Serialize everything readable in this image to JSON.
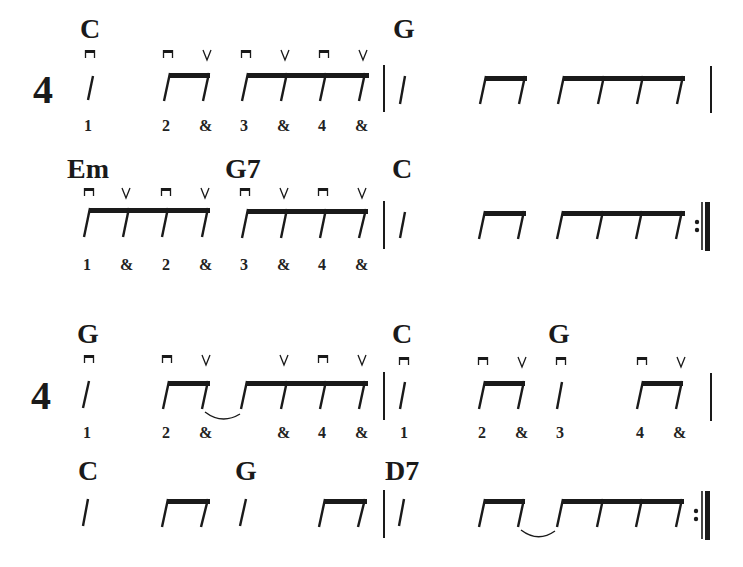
{
  "page": {
    "time_signature": "4",
    "colors": {
      "ink": "#1a1a1a",
      "paper": "#ffffff"
    }
  },
  "systems": [
    {
      "id": "system-1",
      "time_signature": "4",
      "lines": [
        {
          "id": "line-1",
          "chords": [
            {
              "label": "C",
              "x": 80,
              "y": 38
            },
            {
              "label": "G",
              "x": 393,
              "y": 38
            }
          ],
          "strokes": [
            {
              "type": "down",
              "x": 90
            },
            {
              "type": "down",
              "x": 168
            },
            {
              "type": "up",
              "x": 207
            },
            {
              "type": "down",
              "x": 246
            },
            {
              "type": "up",
              "x": 285
            },
            {
              "type": "down",
              "x": 324
            },
            {
              "type": "up",
              "x": 363
            }
          ],
          "counts": [
            {
              "text": "1",
              "x": 88
            },
            {
              "text": "2",
              "x": 166
            },
            {
              "text": "&",
              "x": 205
            },
            {
              "text": "3",
              "x": 244
            },
            {
              "text": "&",
              "x": 283
            },
            {
              "text": "4",
              "x": 322
            },
            {
              "text": "&",
              "x": 361
            }
          ]
        },
        {
          "id": "line-2",
          "chords": [
            {
              "label": "Em",
              "x": 67,
              "y": 178
            },
            {
              "label": "G7",
              "x": 225,
              "y": 178
            },
            {
              "label": "C",
              "x": 392,
              "y": 178
            }
          ],
          "strokes": [
            {
              "type": "down",
              "x": 90
            },
            {
              "type": "up",
              "x": 126
            },
            {
              "type": "down",
              "x": 166
            },
            {
              "type": "up",
              "x": 205
            },
            {
              "type": "down",
              "x": 245
            },
            {
              "type": "up",
              "x": 284
            },
            {
              "type": "down",
              "x": 323
            },
            {
              "type": "up",
              "x": 362
            }
          ],
          "counts": [
            {
              "text": "1",
              "x": 87
            },
            {
              "text": "&",
              "x": 126
            },
            {
              "text": "2",
              "x": 166
            },
            {
              "text": "&",
              "x": 205
            },
            {
              "text": "3",
              "x": 244
            },
            {
              "text": "&",
              "x": 283
            },
            {
              "text": "4",
              "x": 322
            },
            {
              "text": "&",
              "x": 361
            }
          ]
        }
      ]
    },
    {
      "id": "system-2",
      "time_signature": "4",
      "lines": [
        {
          "id": "line-3",
          "chords": [
            {
              "label": "G",
              "x": 77,
              "y": 343
            },
            {
              "label": "C",
              "x": 392,
              "y": 343
            },
            {
              "label": "G",
              "x": 548,
              "y": 343
            }
          ],
          "strokes": [
            {
              "type": "down",
              "x": 89
            },
            {
              "type": "down",
              "x": 167
            },
            {
              "type": "up",
              "x": 206
            },
            {
              "type": "up",
              "x": 284
            },
            {
              "type": "down",
              "x": 323
            },
            {
              "type": "up",
              "x": 362
            },
            {
              "type": "down",
              "x": 404
            },
            {
              "type": "down",
              "x": 483
            },
            {
              "type": "up",
              "x": 521
            },
            {
              "type": "down",
              "x": 561
            },
            {
              "type": "down",
              "x": 641
            },
            {
              "type": "up",
              "x": 680
            }
          ],
          "counts": [
            {
              "text": "1",
              "x": 87
            },
            {
              "text": "2",
              "x": 166
            },
            {
              "text": "&",
              "x": 205
            },
            {
              "text": "&",
              "x": 283
            },
            {
              "text": "4",
              "x": 322
            },
            {
              "text": "&",
              "x": 361
            },
            {
              "text": "1",
              "x": 403
            },
            {
              "text": "2",
              "x": 482
            },
            {
              "text": "&",
              "x": 521
            },
            {
              "text": "3",
              "x": 560
            },
            {
              "text": "4",
              "x": 640
            },
            {
              "text": "&",
              "x": 679
            }
          ]
        },
        {
          "id": "line-4",
          "chords": [
            {
              "label": "C",
              "x": 78,
              "y": 480
            },
            {
              "label": "G",
              "x": 235,
              "y": 480
            },
            {
              "label": "D7",
              "x": 385,
              "y": 480
            }
          ],
          "strokes": [],
          "counts": []
        }
      ]
    }
  ],
  "legend": {
    "down_stroke_symbol": "⊓",
    "up_stroke_symbol": "V",
    "repeat_end": ":||"
  }
}
